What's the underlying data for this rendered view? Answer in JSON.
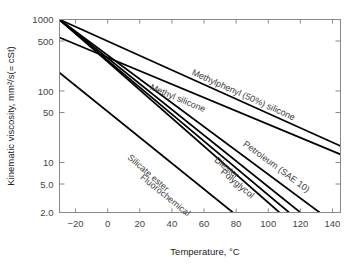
{
  "chart_data": {
    "type": "line",
    "title": "",
    "xlabel": "Temperature, °C",
    "ylabel": "Kinematic viscosity, mm²/s(= cSt)",
    "yscale": "log",
    "xlim": [
      -30,
      145
    ],
    "ylim": [
      2.0,
      1000
    ],
    "grid": false,
    "legend": "inline-curve-labels",
    "xticks": [
      -20,
      0,
      20,
      40,
      60,
      80,
      100,
      120,
      140
    ],
    "xtick_labels": [
      "−20",
      "0",
      "20",
      "40",
      "60",
      "80",
      "100",
      "120",
      "140"
    ],
    "yticks": [
      1000,
      500,
      100,
      50,
      10,
      5.0,
      2.0
    ],
    "ytick_labels": [
      "1000",
      "500",
      "100",
      "50",
      "10",
      "5.0",
      "2.0"
    ],
    "series": [
      {
        "name": "Methylphenyl (50%) silicone",
        "label": "Methylphenyl (50%) silicone",
        "label_x": 52,
        "label_y": 170,
        "points": [
          [
            -30,
            1000
          ],
          [
            145,
            17
          ]
        ]
      },
      {
        "name": "Methyl silicone",
        "label": "Methyl silicone",
        "label_x": 26,
        "label_y": 105,
        "points": [
          [
            -30,
            560
          ],
          [
            145,
            13
          ]
        ]
      },
      {
        "name": "Petroleum (SAE 10)",
        "label": "Petroleum (SAE 10)",
        "label_x": 84,
        "label_y": 17.5,
        "points": [
          [
            -30,
            1000
          ],
          [
            132,
            2.0
          ]
        ]
      },
      {
        "name": "Diester",
        "label": "Diester",
        "label_x": 66,
        "label_y": 10.5,
        "points": [
          [
            -30,
            1000
          ],
          [
            120,
            2.0
          ]
        ]
      },
      {
        "name": "Polyglycol",
        "label": "Polyglycol",
        "label_x": 70,
        "label_y": 7.2,
        "points": [
          [
            -30,
            980
          ],
          [
            113,
            2.0
          ]
        ]
      },
      {
        "name": "Silicate ester",
        "label": "Silicate ester",
        "label_x": 12,
        "label_y": 11.5,
        "points": [
          [
            -30,
            1000
          ],
          [
            107,
            2.0
          ]
        ]
      },
      {
        "name": "Fluorochemical",
        "label": "Fluorochemical",
        "label_x": 20,
        "label_y": 6.0,
        "points": [
          [
            -30,
            180
          ],
          [
            78,
            2.0
          ]
        ]
      }
    ]
  }
}
